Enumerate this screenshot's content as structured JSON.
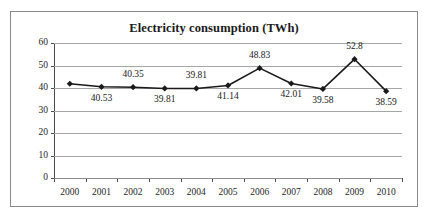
{
  "chart_data": {
    "type": "line",
    "title": "Electricity consumption (TWh)",
    "xlabel": "",
    "ylabel": "",
    "categories": [
      "2000",
      "2001",
      "2002",
      "2003",
      "2004",
      "2005",
      "2006",
      "2007",
      "2008",
      "2009",
      "2010"
    ],
    "values": [
      41.9,
      40.53,
      40.35,
      39.81,
      39.81,
      41.14,
      48.83,
      42.01,
      39.58,
      52.8,
      38.59
    ],
    "point_labels": [
      "",
      "40.53",
      "40.35",
      "39.81",
      "39.81",
      "41.14",
      "48.83",
      "42.01",
      "39.58",
      "52.8",
      "38.59"
    ],
    "label_positions": [
      "none",
      "below",
      "above",
      "below",
      "above",
      "below",
      "above",
      "below",
      "below",
      "above",
      "below"
    ],
    "ylim": [
      0,
      60
    ],
    "y_ticks": [
      "0",
      "10",
      "20",
      "30",
      "40",
      "50",
      "60"
    ],
    "grid": true,
    "legend": "none",
    "marker": "diamond",
    "series_color": "#1a1a1a",
    "gridline_color": "#a6a6a6",
    "axis_color": "#4d4d4d",
    "background_color": "#ffffff"
  }
}
